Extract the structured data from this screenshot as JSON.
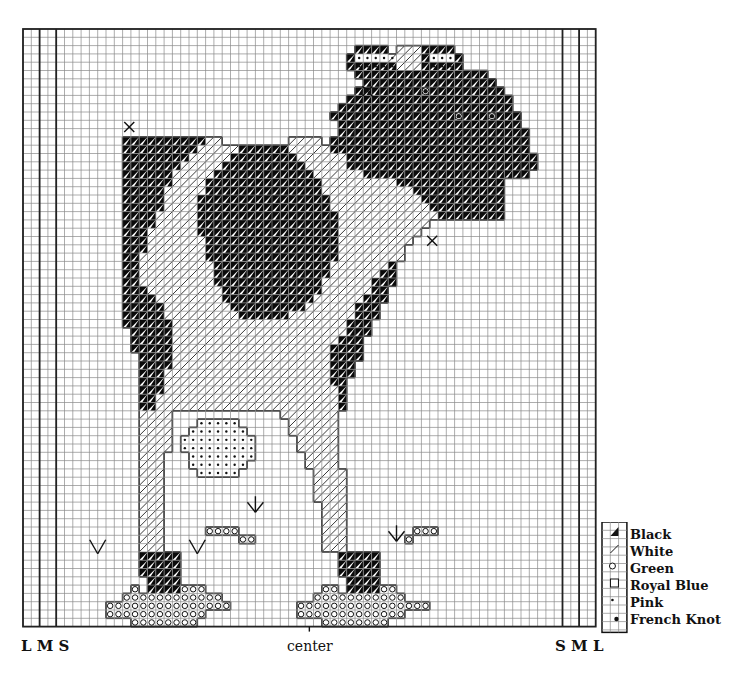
{
  "grid": {
    "x0": 23,
    "y0": 29,
    "cell": 8.3,
    "cols": 69,
    "rows": 72,
    "heavy_cols": [
      2,
      4,
      65,
      67
    ],
    "line_color": "#222222",
    "grid_color": "#8a8a8a"
  },
  "labels": {
    "left": "L M S",
    "center": "center",
    "right": "S M L"
  },
  "legend": {
    "items": [
      {
        "symbol": "half-black-triangle",
        "label": "Black"
      },
      {
        "symbol": "diagonal-slash",
        "label": "White"
      },
      {
        "symbol": "open-circle",
        "label": "Green"
      },
      {
        "symbol": "empty-square",
        "label": "Royal Blue"
      },
      {
        "symbol": "small-dot",
        "label": "Pink"
      },
      {
        "symbol": "large-dot",
        "label": "French Knot"
      }
    ]
  },
  "chart_data": {
    "type": "cross-stitch-pattern",
    "title": "",
    "legend": [
      "Black",
      "White",
      "Green",
      "Royal Blue",
      "Pink",
      "French Knot"
    ],
    "size_marks": {
      "left": [
        "L",
        "M",
        "S"
      ],
      "right": [
        "S",
        "M",
        "L"
      ],
      "center_mark": "center"
    },
    "stitches": {
      "black": [
        [
          2,
          40,
          43
        ],
        [
          2,
          48,
          51
        ],
        [
          3,
          39,
          39
        ],
        [
          3,
          48,
          48
        ],
        [
          3,
          52,
          52
        ],
        [
          4,
          39,
          44
        ],
        [
          4,
          48,
          52
        ],
        [
          5,
          40,
          55
        ],
        [
          6,
          41,
          56
        ],
        [
          7,
          40,
          57
        ],
        [
          8,
          39,
          58
        ],
        [
          9,
          38,
          58
        ],
        [
          10,
          37,
          59
        ],
        [
          11,
          38,
          59
        ],
        [
          12,
          38,
          60
        ],
        [
          13,
          12,
          21
        ],
        [
          13,
          37,
          60
        ],
        [
          14,
          12,
          20
        ],
        [
          14,
          26,
          31
        ],
        [
          14,
          37,
          60
        ],
        [
          15,
          12,
          19
        ],
        [
          15,
          25,
          32
        ],
        [
          15,
          39,
          61
        ],
        [
          16,
          12,
          18
        ],
        [
          16,
          24,
          33
        ],
        [
          16,
          39,
          61
        ],
        [
          17,
          12,
          17
        ],
        [
          17,
          23,
          34
        ],
        [
          17,
          41,
          60
        ],
        [
          18,
          12,
          17
        ],
        [
          18,
          22,
          35
        ],
        [
          18,
          45,
          57
        ],
        [
          19,
          12,
          16
        ],
        [
          19,
          22,
          35
        ],
        [
          19,
          47,
          57
        ],
        [
          20,
          12,
          16
        ],
        [
          20,
          21,
          36
        ],
        [
          20,
          48,
          57
        ],
        [
          21,
          12,
          16
        ],
        [
          21,
          21,
          36
        ],
        [
          21,
          49,
          57
        ],
        [
          22,
          12,
          15
        ],
        [
          22,
          21,
          37
        ],
        [
          22,
          50,
          57
        ],
        [
          23,
          12,
          15
        ],
        [
          23,
          21,
          37
        ],
        [
          24,
          12,
          14
        ],
        [
          24,
          21,
          37
        ],
        [
          25,
          12,
          14
        ],
        [
          25,
          22,
          37
        ],
        [
          26,
          12,
          14
        ],
        [
          26,
          22,
          37
        ],
        [
          27,
          12,
          13
        ],
        [
          27,
          22,
          37
        ],
        [
          28,
          12,
          13
        ],
        [
          28,
          23,
          36
        ],
        [
          28,
          44,
          44
        ],
        [
          29,
          12,
          13
        ],
        [
          29,
          23,
          36
        ],
        [
          29,
          43,
          44
        ],
        [
          30,
          12,
          13
        ],
        [
          30,
          23,
          35
        ],
        [
          30,
          42,
          44
        ],
        [
          31,
          12,
          14
        ],
        [
          31,
          24,
          35
        ],
        [
          31,
          42,
          43
        ],
        [
          32,
          12,
          15
        ],
        [
          32,
          24,
          34
        ],
        [
          32,
          41,
          43
        ],
        [
          33,
          12,
          16
        ],
        [
          33,
          25,
          33
        ],
        [
          33,
          40,
          42
        ],
        [
          34,
          12,
          16
        ],
        [
          34,
          26,
          31
        ],
        [
          34,
          40,
          42
        ],
        [
          35,
          12,
          17
        ],
        [
          35,
          39,
          41
        ],
        [
          36,
          13,
          17
        ],
        [
          36,
          39,
          41
        ],
        [
          37,
          13,
          17
        ],
        [
          37,
          38,
          40
        ],
        [
          38,
          13,
          17
        ],
        [
          38,
          37,
          40
        ],
        [
          39,
          14,
          17
        ],
        [
          39,
          37,
          40
        ],
        [
          40,
          14,
          17
        ],
        [
          40,
          37,
          39
        ],
        [
          41,
          14,
          16
        ],
        [
          41,
          37,
          39
        ],
        [
          42,
          14,
          16
        ],
        [
          42,
          37,
          38
        ],
        [
          43,
          14,
          16
        ],
        [
          43,
          38,
          38
        ],
        [
          44,
          14,
          15
        ],
        [
          44,
          38,
          38
        ],
        [
          45,
          14,
          15
        ],
        [
          45,
          38,
          38
        ],
        [
          63,
          14,
          18
        ],
        [
          63,
          38,
          42
        ],
        [
          64,
          14,
          18
        ],
        [
          64,
          38,
          42
        ],
        [
          65,
          14,
          18
        ],
        [
          65,
          38,
          42
        ],
        [
          66,
          15,
          18
        ],
        [
          66,
          39,
          42
        ],
        [
          67,
          15,
          18
        ],
        [
          67,
          39,
          42
        ]
      ],
      "white": [
        [
          2,
          45,
          47
        ],
        [
          3,
          44,
          47
        ],
        [
          4,
          45,
          47
        ],
        [
          13,
          22,
          23
        ],
        [
          13,
          32,
          35
        ],
        [
          14,
          21,
          25
        ],
        [
          14,
          32,
          36
        ],
        [
          15,
          20,
          24
        ],
        [
          15,
          33,
          38
        ],
        [
          16,
          19,
          23
        ],
        [
          16,
          34,
          38
        ],
        [
          17,
          18,
          22
        ],
        [
          17,
          35,
          40
        ],
        [
          18,
          18,
          21
        ],
        [
          18,
          36,
          44
        ],
        [
          19,
          17,
          21
        ],
        [
          19,
          36,
          46
        ],
        [
          20,
          17,
          20
        ],
        [
          20,
          37,
          47
        ],
        [
          21,
          17,
          20
        ],
        [
          21,
          37,
          48
        ],
        [
          22,
          16,
          20
        ],
        [
          22,
          38,
          49
        ],
        [
          23,
          16,
          20
        ],
        [
          23,
          38,
          48
        ],
        [
          24,
          15,
          20
        ],
        [
          24,
          38,
          47
        ],
        [
          25,
          15,
          21
        ],
        [
          25,
          38,
          46
        ],
        [
          26,
          15,
          21
        ],
        [
          26,
          38,
          45
        ],
        [
          27,
          14,
          21
        ],
        [
          27,
          38,
          45
        ],
        [
          28,
          14,
          22
        ],
        [
          28,
          37,
          43
        ],
        [
          29,
          14,
          22
        ],
        [
          29,
          37,
          42
        ],
        [
          30,
          14,
          22
        ],
        [
          30,
          36,
          41
        ],
        [
          31,
          15,
          23
        ],
        [
          31,
          36,
          41
        ],
        [
          32,
          16,
          23
        ],
        [
          32,
          35,
          40
        ],
        [
          33,
          17,
          24
        ],
        [
          33,
          34,
          39
        ],
        [
          34,
          17,
          25
        ],
        [
          34,
          32,
          39
        ],
        [
          35,
          18,
          38
        ],
        [
          36,
          18,
          38
        ],
        [
          37,
          18,
          37
        ],
        [
          38,
          18,
          36
        ],
        [
          39,
          18,
          36
        ],
        [
          40,
          18,
          36
        ],
        [
          41,
          17,
          36
        ],
        [
          42,
          17,
          36
        ],
        [
          43,
          17,
          37
        ],
        [
          44,
          16,
          37
        ],
        [
          45,
          16,
          37
        ],
        [
          46,
          14,
          17
        ],
        [
          46,
          31,
          37
        ],
        [
          47,
          14,
          17
        ],
        [
          47,
          32,
          37
        ],
        [
          48,
          14,
          17
        ],
        [
          48,
          32,
          37
        ],
        [
          49,
          14,
          17
        ],
        [
          49,
          33,
          37
        ],
        [
          50,
          14,
          17
        ],
        [
          50,
          33,
          37
        ],
        [
          51,
          14,
          16
        ],
        [
          51,
          34,
          37
        ],
        [
          52,
          14,
          16
        ],
        [
          52,
          34,
          37
        ],
        [
          53,
          14,
          16
        ],
        [
          53,
          35,
          38
        ],
        [
          54,
          14,
          16
        ],
        [
          54,
          35,
          38
        ],
        [
          55,
          14,
          16
        ],
        [
          55,
          35,
          38
        ],
        [
          56,
          14,
          16
        ],
        [
          56,
          35,
          38
        ],
        [
          57,
          14,
          16
        ],
        [
          57,
          36,
          38
        ],
        [
          58,
          14,
          16
        ],
        [
          58,
          36,
          38
        ],
        [
          59,
          14,
          16
        ],
        [
          59,
          36,
          38
        ],
        [
          60,
          14,
          16
        ],
        [
          60,
          36,
          38
        ],
        [
          61,
          14,
          16
        ],
        [
          61,
          36,
          38
        ],
        [
          62,
          14,
          16
        ],
        [
          62,
          36,
          38
        ]
      ],
      "pink": [
        [
          3,
          40,
          44
        ],
        [
          3,
          49,
          51
        ],
        [
          4,
          40,
          44
        ],
        [
          4,
          49,
          51
        ],
        [
          47,
          21,
          25
        ],
        [
          48,
          20,
          26
        ],
        [
          49,
          19,
          27
        ],
        [
          50,
          19,
          27
        ],
        [
          51,
          20,
          27
        ],
        [
          52,
          20,
          26
        ],
        [
          53,
          21,
          25
        ]
      ],
      "green": [
        [
          60,
          22,
          25
        ],
        [
          61,
          26,
          27
        ],
        [
          60,
          47,
          49
        ],
        [
          61,
          46,
          46
        ],
        [
          67,
          13,
          13
        ],
        [
          67,
          19,
          21
        ],
        [
          68,
          12,
          23
        ],
        [
          69,
          10,
          24
        ],
        [
          70,
          10,
          21
        ],
        [
          71,
          13,
          20
        ],
        [
          67,
          36,
          37
        ],
        [
          67,
          43,
          44
        ],
        [
          68,
          35,
          45
        ],
        [
          69,
          33,
          48
        ],
        [
          70,
          33,
          45
        ],
        [
          71,
          36,
          43
        ]
      ],
      "french_knots": [
        [
          7,
          48
        ],
        [
          10,
          52
        ],
        [
          10,
          56
        ]
      ],
      "straight_stitch_marks": [
        {
          "type": "x",
          "at": [
            12.8,
            11.8
          ]
        },
        {
          "type": "x",
          "at": [
            41.5,
            7.5
          ]
        },
        {
          "type": "x",
          "at": [
            49.3,
            25.5
          ]
        },
        {
          "type": "v",
          "at": [
            9,
            62.5
          ]
        },
        {
          "type": "v",
          "at": [
            21,
            62.5
          ]
        },
        {
          "type": "v-arrow",
          "at": [
            28,
            57.5
          ]
        },
        {
          "type": "v-arrow",
          "at": [
            45,
            61
          ]
        }
      ]
    }
  }
}
